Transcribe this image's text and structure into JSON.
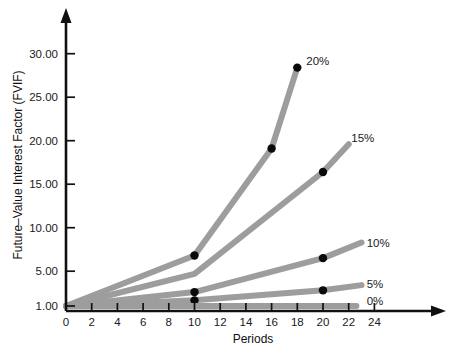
{
  "chart_data": {
    "type": "line",
    "title": "",
    "xlabel": "Periods",
    "ylabel": "Future–Value Interest Factor (FVIF)",
    "xlim": [
      0,
      25.5
    ],
    "ylim": [
      1.0,
      33.0
    ],
    "xticks": [
      0,
      2,
      4,
      6,
      8,
      10,
      12,
      14,
      16,
      18,
      20,
      22,
      24
    ],
    "xtick_labels": [
      "0",
      "2",
      "4",
      "6",
      "8",
      "10",
      "12",
      "14",
      "16",
      "18",
      "20",
      "22",
      "24"
    ],
    "yticks": [
      1.0,
      5.0,
      10.0,
      15.0,
      20.0,
      25.0,
      30.0
    ],
    "ytick_labels": [
      "1.00",
      "5.00",
      "10.00",
      "15.00",
      "20.00",
      "25.00",
      "30.00"
    ],
    "grid": false,
    "legend_position": "line-end-labels",
    "line_color": "#9d9d9d",
    "line_width": 6,
    "marker_color": "#0a0a0a",
    "axis_color": "#111111",
    "series": [
      {
        "name": "20%",
        "label": "20%",
        "x": [
          0,
          10,
          16,
          18
        ],
        "values": [
          1.0,
          6.8,
          19.1,
          28.4
        ],
        "markers": [
          {
            "x": 10,
            "y": 6.8
          },
          {
            "x": 16,
            "y": 19.1
          },
          {
            "x": 18,
            "y": 28.4
          }
        ],
        "label_at": {
          "x": 18.7,
          "y": 29.2
        }
      },
      {
        "name": "15%",
        "label": "15%",
        "x": [
          0,
          10,
          20,
          22
        ],
        "values": [
          1.0,
          4.7,
          16.4,
          19.6
        ],
        "markers": [
          {
            "x": 20,
            "y": 16.4
          }
        ],
        "label_at": {
          "x": 22.2,
          "y": 20.3
        }
      },
      {
        "name": "10%",
        "label": "10%",
        "x": [
          0,
          10,
          20,
          23
        ],
        "values": [
          1.0,
          2.6,
          6.5,
          8.3
        ],
        "markers": [
          {
            "x": 10,
            "y": 2.6
          },
          {
            "x": 20,
            "y": 6.5
          }
        ],
        "label_at": {
          "x": 23.4,
          "y": 8.2
        }
      },
      {
        "name": "5%",
        "label": "5%",
        "x": [
          0,
          10,
          20,
          23
        ],
        "values": [
          1.0,
          1.65,
          2.8,
          3.4
        ],
        "markers": [
          {
            "x": 10,
            "y": 1.65
          },
          {
            "x": 20,
            "y": 2.8
          }
        ],
        "label_at": {
          "x": 23.4,
          "y": 3.5
        }
      },
      {
        "name": "0%",
        "label": "0%",
        "x": [
          0,
          22.6
        ],
        "values": [
          1.0,
          1.0
        ],
        "markers": [],
        "label_at": {
          "x": 23.4,
          "y": 1.6
        }
      }
    ]
  }
}
